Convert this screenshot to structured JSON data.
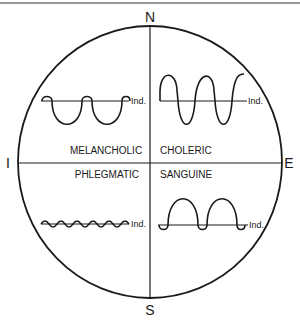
{
  "diagram": {
    "compass": {
      "north": "N",
      "south": "S",
      "west": "I",
      "east": "E"
    },
    "quadrants": [
      {
        "id": "melancholic",
        "label": "MELANCHOLIC",
        "wave_label": "Ind."
      },
      {
        "id": "choleric",
        "label": "CHOLERIC",
        "wave_label": "Ind."
      },
      {
        "id": "phlegmatic",
        "label": "PHLEGMATIC",
        "wave_label": "Ind."
      },
      {
        "id": "sanguine",
        "label": "SANGUINE",
        "wave_label": "Ind."
      }
    ],
    "colors": {
      "line": "#1a1a1a",
      "background": "#ffffff"
    }
  }
}
